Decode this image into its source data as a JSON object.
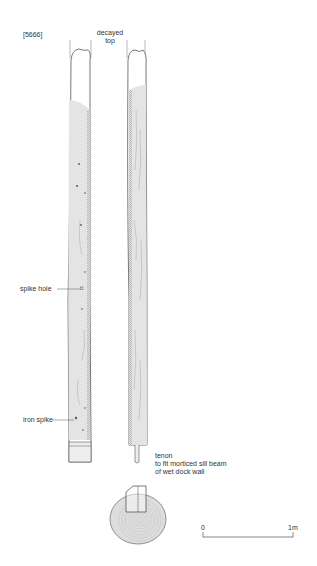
{
  "figure": {
    "context_number": "[5666]",
    "top_label_line1": "decayed",
    "top_label_line2": "top",
    "labels": {
      "spike_hole": "spike hole",
      "iron_spike": "iron spike",
      "tenon_line1": "tenon",
      "tenon_line2": "to fit morticed sill beam",
      "tenon_line3": "of wet dock wall"
    },
    "scale_bar": {
      "start": "0",
      "end": "1m"
    },
    "colors": {
      "outline": "#555555",
      "fill": "#e4e4e4",
      "text": "#333333"
    }
  }
}
